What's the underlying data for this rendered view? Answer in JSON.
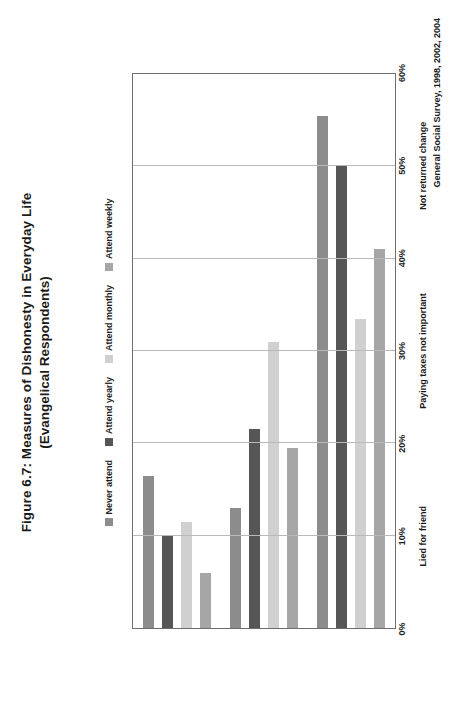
{
  "title": "Figure 6.7: Measures of Dishonesty in Everyday Life",
  "subtitle": "(Evangelical Respondents)",
  "source_note": "General Social Survey, 1998, 2002, 2004",
  "chart_data": {
    "type": "bar",
    "orientation": "vertical",
    "title": "Figure 6.7: Measures of Dishonesty in Everyday Life",
    "subtitle": "(Evangelical Respondents)",
    "xlabel": "",
    "ylabel": "",
    "ylim": [
      0,
      60
    ],
    "ytick_labels": [
      "0%",
      "10%",
      "20%",
      "30%",
      "40%",
      "50%",
      "60%"
    ],
    "ytick_values": [
      0,
      10,
      20,
      30,
      40,
      50,
      60
    ],
    "grid": true,
    "legend_position": "top-center",
    "categories": [
      "Lied for friend",
      "Paying taxes not important",
      "Not returned change"
    ],
    "series": [
      {
        "name": "Never attend",
        "color": "#8c8c8c",
        "values": [
          16.5,
          13.0,
          55.5
        ]
      },
      {
        "name": "Attend yearly",
        "color": "#565656",
        "values": [
          10.0,
          21.5,
          50.0
        ]
      },
      {
        "name": "Attend monthly",
        "color": "#d0d0d0",
        "values": [
          11.5,
          31.0,
          33.5
        ]
      },
      {
        "name": "Attend weekly",
        "color": "#a6a6a6",
        "values": [
          6.0,
          19.5,
          41.0
        ]
      }
    ]
  },
  "legend": {
    "items": [
      {
        "label": "Never attend",
        "color": "#8c8c8c"
      },
      {
        "label": "Attend yearly",
        "color": "#565656"
      },
      {
        "label": "Attend monthly",
        "color": "#d0d0d0"
      },
      {
        "label": "Attend weekly",
        "color": "#a6a6a6"
      }
    ]
  }
}
